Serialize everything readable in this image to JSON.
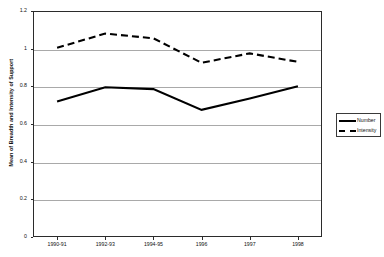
{
  "chart_data": {
    "type": "line",
    "title": "",
    "xlabel": "",
    "ylabel": "Mean of Breadth and Intensity of Support",
    "categories": [
      "1990-91",
      "1992-93",
      "1994-95",
      "1996",
      "1997",
      "1998"
    ],
    "ylim": [
      0,
      1.2
    ],
    "yticks": [
      0,
      0.2,
      0.4,
      0.6,
      0.8,
      1,
      1.2
    ],
    "ytick_labels": [
      "0",
      "0.2",
      "0.4",
      "0.6",
      "0.8",
      "1",
      "1.2"
    ],
    "grid": true,
    "legend_position": "right",
    "series": [
      {
        "name": "Number",
        "style": "solid",
        "color": "#000000",
        "values": [
          0.72,
          0.795,
          0.785,
          0.675,
          0.735,
          0.8
        ]
      },
      {
        "name": "Intensity",
        "style": "dashed",
        "color": "#000000",
        "values": [
          1.005,
          1.08,
          1.055,
          0.925,
          0.975,
          0.93
        ]
      }
    ]
  },
  "axis": {
    "y_title": "Mean of Breadth and Intensity of Support"
  },
  "legend": {
    "entries": [
      {
        "label": "Number"
      },
      {
        "label": "Intensity"
      }
    ]
  }
}
